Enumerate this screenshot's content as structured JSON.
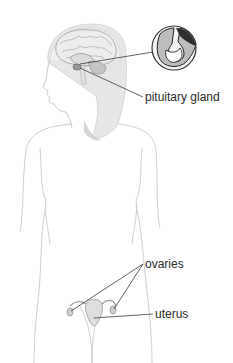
{
  "diagram": {
    "labels": {
      "pituitary": "pituitary gland",
      "ovaries": "ovaries",
      "uterus": "uterus"
    },
    "inset": "magnified pituitary gland cross-section",
    "colors": {
      "outline": "#c8c8c8",
      "hair": "#d9d9d9",
      "leader_line": "#3a3a3a",
      "label_text": "#2a2a2a",
      "organ_fill": "#d6d6d6"
    }
  }
}
